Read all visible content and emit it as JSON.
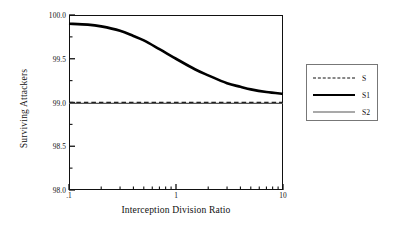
{
  "chart_data": {
    "type": "line",
    "title": "",
    "xlabel": "Interception Division Ratio",
    "ylabel": "Surviving Attackers",
    "xscale": "log",
    "xlim": [
      0.1,
      10
    ],
    "ylim": [
      98.0,
      100.0
    ],
    "grid": false,
    "legend_position": "right-outside",
    "x_ticks": [
      {
        "value": 0.1,
        "label": ".1"
      },
      {
        "value": 1,
        "label": "1"
      },
      {
        "value": 10,
        "label": "10"
      }
    ],
    "y_ticks": [
      {
        "value": 100.0,
        "label": "100.0"
      },
      {
        "value": 99.5,
        "label": "99.5"
      },
      {
        "value": 99.0,
        "label": "99.0"
      },
      {
        "value": 98.5,
        "label": "98.5"
      },
      {
        "value": 98.0,
        "label": "98.0"
      }
    ],
    "y_minor_ticks": [
      99.75,
      99.25,
      98.75,
      98.25
    ],
    "series": [
      {
        "name": "S",
        "style": "dashed",
        "color": "#111111",
        "width": 1.6,
        "x": [
          0.1,
          0.2,
          0.5,
          1,
          2,
          5,
          10
        ],
        "values": [
          99.0,
          99.0,
          99.0,
          99.0,
          99.0,
          99.0,
          99.0
        ]
      },
      {
        "name": "S1",
        "style": "solid",
        "color": "#000000",
        "width": 2.6,
        "x": [
          0.1,
          0.15,
          0.2,
          0.3,
          0.4,
          0.5,
          0.7,
          1.0,
          1.5,
          2.0,
          3.0,
          4.0,
          5.0,
          7.0,
          10.0
        ],
        "values": [
          99.9,
          99.89,
          99.87,
          99.82,
          99.76,
          99.71,
          99.61,
          99.5,
          99.38,
          99.31,
          99.22,
          99.18,
          99.15,
          99.12,
          99.1
        ]
      },
      {
        "name": "S2",
        "style": "solid",
        "color": "#555555",
        "width": 1.2,
        "x": [
          0.1,
          0.5,
          1,
          2,
          5,
          10
        ],
        "values": [
          98.99,
          98.99,
          98.99,
          98.99,
          98.99,
          98.99
        ]
      }
    ]
  },
  "legend": {
    "entries": [
      {
        "label": "S"
      },
      {
        "label": "S1"
      },
      {
        "label": "S2"
      }
    ]
  }
}
